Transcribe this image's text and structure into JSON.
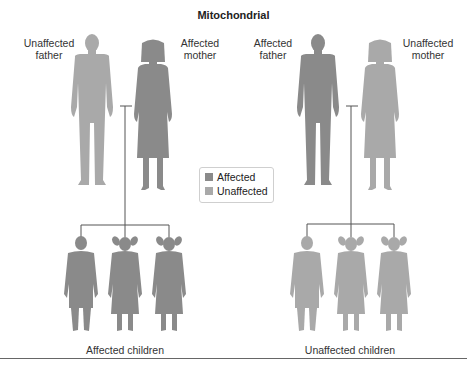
{
  "title": "Mitochondrial",
  "colors": {
    "affected": "#8a8a8a",
    "unaffected": "#a9a9a9",
    "line": "#555555"
  },
  "legend": {
    "items": [
      {
        "label": "Affected",
        "status": "affected"
      },
      {
        "label": "Unaffected",
        "status": "unaffected"
      }
    ]
  },
  "families": [
    {
      "father_label": "Unaffected father",
      "father_line1": "Unaffected",
      "father_line2": "father",
      "mother_label": "Affected mother",
      "mother_line1": "Affected",
      "mother_line2": "mother",
      "father_status": "unaffected",
      "mother_status": "affected",
      "children_status": "affected",
      "children": [
        "boy",
        "girl",
        "girl"
      ],
      "caption": "Affected children"
    },
    {
      "father_line1": "Affected",
      "father_line2": "father",
      "mother_line1": "Unaffected",
      "mother_line2": "mother",
      "father_status": "affected",
      "mother_status": "unaffected",
      "children_status": "unaffected",
      "children": [
        "boy",
        "girl",
        "girl"
      ],
      "caption": "Unaffected children"
    }
  ]
}
